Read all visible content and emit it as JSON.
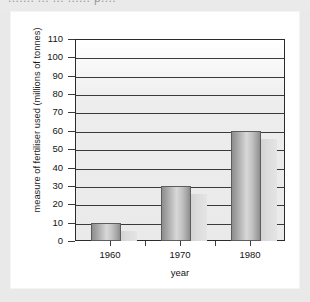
{
  "top_clipped_text": "....... ... ... ...... p....",
  "chart_data": {
    "type": "bar",
    "title": "",
    "subtitle": "",
    "xlabel": "year",
    "ylabel": "measure of fertiliser used (millions of tonnes)",
    "categories": [
      "1960",
      "1970",
      "1980"
    ],
    "values": [
      10,
      30,
      60
    ],
    "series": [
      {
        "name": "measure of fertiliser used (millions of tonnes)",
        "values": [
          10,
          30,
          60
        ]
      }
    ],
    "ylim": [
      0,
      110
    ],
    "ytick_step": 10,
    "yticks": [
      0,
      10,
      20,
      30,
      40,
      50,
      60,
      70,
      80,
      90,
      100,
      110
    ],
    "ytick_labels": [
      "0",
      "10",
      "20",
      "30",
      "40",
      "50",
      "60",
      "70",
      "80",
      "90",
      "100",
      "110"
    ],
    "xticks": [
      "1960",
      "1970",
      "1980"
    ],
    "grid": true,
    "grid_axis": "y",
    "legend": false,
    "legend_position": "none",
    "style": "3d-bars-greyscale",
    "colors": {
      "bar_front_light": "#d8d8d8",
      "bar_front_dark": "#8d8d8d",
      "bar_side": "#dcdcdc",
      "bar_outline": "#5d5d5d",
      "grid": "#3a3a3a",
      "axis": "#2b2b2b",
      "plot_background": "#eaeaea",
      "page_background": "#e9e9e9",
      "card_background": "#ffffff",
      "text": "#141414"
    }
  }
}
